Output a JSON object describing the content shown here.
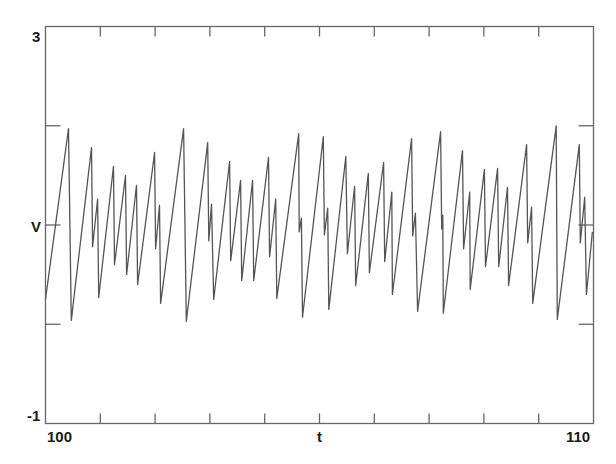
{
  "chart_data": {
    "type": "line",
    "title": "",
    "xlabel": "t",
    "ylabel": "V",
    "xlim": [
      100,
      110
    ],
    "ylim": [
      -1,
      3
    ],
    "x_tick_labels": [
      "100",
      "110"
    ],
    "y_tick_labels": [
      "3",
      "-1"
    ],
    "x_minor_ticks": [
      101,
      102,
      103,
      104,
      105,
      106,
      107,
      108,
      109
    ],
    "y_minor_ticks": [
      0,
      1,
      2
    ],
    "grid": false,
    "legend": null,
    "line_color": "#555555",
    "axis_color": "#666666",
    "series": [
      {
        "name": "V(t)",
        "x": [
          100.0,
          100.42,
          100.47,
          100.84,
          100.86,
          100.95,
          100.97,
          101.24,
          101.26,
          101.46,
          101.48,
          101.66,
          101.68,
          101.99,
          102.01,
          102.08,
          102.1,
          102.52,
          102.57,
          102.96,
          102.98,
          103.03,
          103.07,
          103.36,
          103.38,
          103.56,
          103.58,
          103.78,
          103.8,
          104.07,
          104.09,
          104.2,
          104.22,
          104.62,
          104.63,
          104.67,
          104.69,
          105.07,
          105.09,
          105.15,
          105.17,
          105.48,
          105.51,
          105.64,
          105.66,
          105.89,
          105.91,
          106.17,
          106.19,
          106.32,
          106.33,
          106.68,
          106.7,
          106.75,
          106.79,
          107.21,
          107.23,
          107.25,
          107.26,
          107.61,
          107.63,
          107.74,
          107.75,
          108.01,
          108.03,
          108.25,
          108.27,
          108.43,
          108.45,
          108.78,
          108.8,
          108.87,
          108.89,
          109.32,
          109.34,
          109.74,
          109.76,
          109.84,
          109.87,
          109.98
        ],
        "y": [
          0.25,
          1.97,
          0.04,
          1.78,
          0.78,
          1.26,
          0.27,
          1.59,
          0.6,
          1.5,
          0.5,
          1.4,
          0.4,
          1.73,
          0.76,
          1.2,
          0.21,
          1.97,
          0.03,
          1.83,
          0.84,
          1.21,
          0.25,
          1.64,
          0.64,
          1.45,
          0.44,
          1.45,
          0.44,
          1.68,
          0.68,
          1.26,
          0.26,
          1.92,
          0.93,
          1.07,
          0.07,
          1.89,
          0.9,
          1.17,
          0.15,
          1.69,
          0.71,
          1.39,
          0.39,
          1.52,
          0.52,
          1.63,
          0.63,
          1.33,
          0.3,
          1.87,
          0.89,
          1.12,
          0.13,
          1.94,
          0.96,
          1.1,
          0.11,
          1.75,
          0.76,
          1.33,
          0.35,
          1.56,
          0.58,
          1.57,
          0.58,
          1.38,
          0.39,
          1.81,
          0.82,
          1.18,
          0.21,
          2.0,
          0.05,
          1.81,
          0.82,
          1.28,
          0.3,
          0.93
        ]
      }
    ]
  },
  "labels": {
    "y_top": "3",
    "y_bottom": "-1",
    "y_axis": "V",
    "x_left": "100",
    "x_right": "110",
    "x_axis": "t"
  }
}
